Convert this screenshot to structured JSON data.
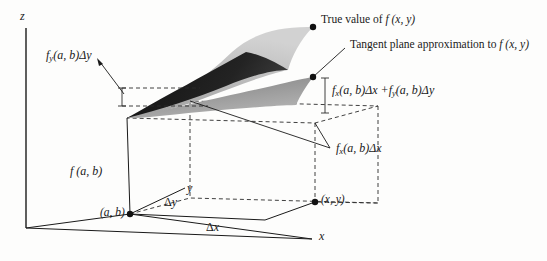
{
  "figure": {
    "kind": "tangent-plane-approximation-diagram",
    "axes": {
      "z_label": "z",
      "y_label": "y",
      "x_label": "x"
    },
    "points": {
      "base_point": "(a, b)",
      "target_point": "(x, y)"
    },
    "deltas": {
      "dx": "Δx",
      "dy": "Δy"
    },
    "annotations": {
      "true_value": "True value of",
      "true_value_fn": "f (x, y)",
      "tangent_plane": "Tangent plane approximation to",
      "tangent_plane_fn": "f (x, y)",
      "height_base": "f (a, b)",
      "fy_term": "f",
      "fy_sub": "y",
      "fy_rest": "(a, b)Δy",
      "fx_term": "f",
      "fx_sub": "x",
      "fx_rest": "(a, b)Δx",
      "sum_fx": "f",
      "sum_fx_sub": "x",
      "sum_fx_rest": "(a, b)Δx +",
      "sum_fy": "f",
      "sum_fy_sub": "y",
      "sum_fy_rest": "(a, b)Δy"
    },
    "colors": {
      "ink": "#1a1a1a",
      "background": "#fdfdfc",
      "surface_light": "#b9b9b9",
      "surface_mid": "#8f8f8f",
      "surface_dark": "#1e1e1e",
      "plane_tone": "#8c8c8c",
      "dash": "#2b2b2b"
    }
  }
}
